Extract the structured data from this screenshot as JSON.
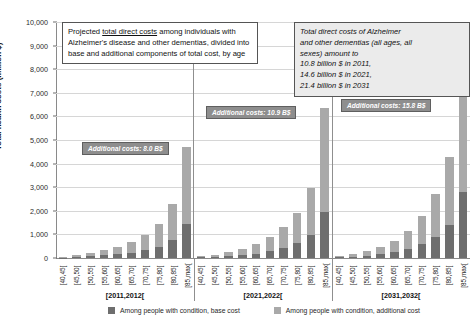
{
  "chart_data": {
    "type": "bar",
    "subtype": "stacked-grouped-bar",
    "title": "",
    "xlabel": "",
    "ylabel": "Total health costs (million $)",
    "ylim": [
      0,
      10000
    ],
    "ytick_labels": [
      "10,000",
      "9,000",
      "8,000",
      "7,000",
      "6,000",
      "5,000",
      "4,000",
      "3,000",
      "2,000",
      "1,000",
      "0"
    ],
    "ytick_values": [
      10000,
      9000,
      8000,
      7000,
      6000,
      5000,
      4000,
      3000,
      2000,
      1000,
      0
    ],
    "grid": true,
    "legend_position": "bottom",
    "categories": [
      "[40,45[",
      "[45,50[",
      "[50,55[",
      "[55,60[",
      "[60,65[",
      "[65,70[",
      "[70,75[",
      "[75,80[",
      "[80,85[",
      "[85,max["
    ],
    "groups": [
      "[2011,2012[",
      "[2021,2022[",
      "[2031,2032["
    ],
    "series": [
      {
        "name": "Among people with condition, base cost",
        "color": "#6e6e6e",
        "values_by_group": [
          [
            20,
            40,
            70,
            110,
            160,
            230,
            330,
            480,
            760,
            1450
          ],
          [
            25,
            45,
            80,
            120,
            190,
            300,
            430,
            620,
            980,
            1950
          ],
          [
            30,
            55,
            95,
            150,
            240,
            380,
            600,
            900,
            1420,
            2800
          ]
        ]
      },
      {
        "name": "Among people with condition, additional cost",
        "color": "#a9a9a9",
        "values_by_group": [
          [
            40,
            80,
            140,
            220,
            320,
            460,
            660,
            960,
            1540,
            3250
          ],
          [
            50,
            90,
            160,
            250,
            390,
            600,
            870,
            1280,
            1970,
            4400
          ],
          [
            60,
            110,
            195,
            310,
            490,
            780,
            1200,
            1800,
            2880,
            6250
          ]
        ]
      }
    ],
    "totals_by_group": [
      [
        60,
        120,
        210,
        330,
        480,
        690,
        990,
        1440,
        2300,
        4700
      ],
      [
        75,
        135,
        240,
        370,
        580,
        900,
        1300,
        1900,
        2950,
        6350
      ],
      [
        90,
        165,
        290,
        460,
        730,
        1160,
        1800,
        2700,
        4300,
        9050
      ]
    ],
    "annotations": [
      {
        "text": "Additional costs: 8.0 B$",
        "group": "[2011,2012["
      },
      {
        "text": "Additional costs: 10.9 B$",
        "group": "[2021,2022["
      },
      {
        "text": "Additional costs: 15.8 B$",
        "group": "[2031,2032["
      }
    ]
  },
  "title_box": {
    "line1_pre": "Projected ",
    "line1_underline": "total direct costs",
    "line1_post": " among",
    "rest": "individuals with Alzheimer's disease and other dementias, divided into base and additional components of total cost, by age"
  },
  "totals_box": {
    "lines": [
      "Total direct costs of Alzheimer",
      "and other dementias (all ages, all",
      "sexes) amount to",
      "10.8 billion $ in 2011,",
      "14.6 billion $ in 2021,",
      "21.4 billion $ in 2031"
    ]
  },
  "legend": {
    "items": [
      {
        "label": "Among people with condition, base cost",
        "color": "#6e6e6e"
      },
      {
        "label": "Among people with condition, additional cost",
        "color": "#a9a9a9"
      }
    ]
  }
}
